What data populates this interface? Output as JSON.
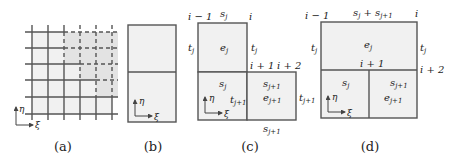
{
  "panels": {
    "a": {
      "caption": "(a)",
      "axis": {
        "vertical": "η",
        "horizontal": "ξ"
      }
    },
    "b": {
      "caption": "(b)",
      "axis": {
        "vertical": "η",
        "horizontal": "ξ"
      }
    },
    "c": {
      "caption": "(c)",
      "corner_labels": {
        "top_left": "i − 1",
        "top_right": "i",
        "mid_right": "i + 1",
        "far_right": "i + 2"
      },
      "top_label": "s",
      "top_label_sub": "j",
      "left_label": "t",
      "left_label_sub": "j",
      "right_label": "t",
      "right_label_sub": "j",
      "upper_element": "e",
      "upper_element_sub": "j",
      "lower_left_top": "s",
      "lower_left_top_sub": "j",
      "lower_mid": "t",
      "lower_mid_sub": "j+1",
      "lower_right_top": "s",
      "lower_right_top_sub": "j+1",
      "lower_right_element": "e",
      "lower_right_element_sub": "j+1",
      "lower_right_side": "t",
      "lower_right_side_sub": "j+1",
      "bottom_label": "s",
      "bottom_label_sub": "j+1",
      "axis": {
        "vertical": "η",
        "horizontal": "ξ"
      }
    },
    "d": {
      "caption": "(d)",
      "corner_labels": {
        "top_left": "i − 1",
        "top_right": "i",
        "mid_center": "i + 1",
        "mid_right": "i + 2"
      },
      "top_label_a": "s",
      "top_label_a_sub": "j",
      "top_plus": " + ",
      "top_label_b": "s",
      "top_label_b_sub": "j+1",
      "left_label": "t",
      "left_label_sub": "j",
      "right_label": "t",
      "right_label_sub": "j",
      "upper_element": "e",
      "upper_element_sub": "j",
      "lower_left_top": "s",
      "lower_left_top_sub": "j",
      "lower_right_top": "s",
      "lower_right_top_sub": "j+1",
      "lower_right_element": "e",
      "lower_right_element_sub": "j+1",
      "left_outside": "t",
      "left_outside_sub": "j+1",
      "axis": {
        "vertical": "η",
        "horizontal": "ξ"
      }
    }
  },
  "colors": {
    "line": "#555555",
    "fill": "#eeeeee",
    "text": "#222222"
  }
}
